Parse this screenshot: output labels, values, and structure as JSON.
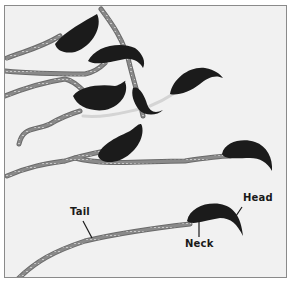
{
  "figure": {
    "colors": {
      "background": "#f1f1f1",
      "frame_border": "#8a8a8a",
      "head": "#1b1b1b",
      "tail_outer": "#6e6e6e",
      "tail_inner": "#bdbdbd",
      "label_text": "#1a1a1a"
    },
    "labels": {
      "head": "Head",
      "neck": "Neck",
      "tail": "Tail"
    },
    "cell_count": 9
  }
}
